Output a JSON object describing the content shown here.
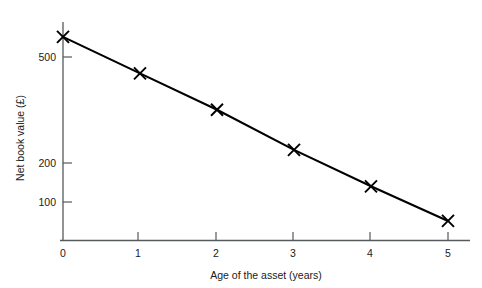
{
  "chart_data": {
    "type": "line",
    "title": "",
    "subtitle": "",
    "xlabel": "Age of the asset (years)",
    "ylabel": "Net book value (£)",
    "x": [
      0,
      1,
      2,
      3,
      4,
      5
    ],
    "values": [
      560,
      460,
      360,
      250,
      150,
      55
    ],
    "series": [
      {
        "name": "Net book value",
        "values": [
          560,
          460,
          360,
          250,
          150,
          55
        ]
      }
    ],
    "xlim": [
      0,
      5.2
    ],
    "ylim": [
      0,
      620
    ],
    "x_tick_labels": [
      "0",
      "1",
      "2",
      "3",
      "4",
      "5"
    ],
    "y_tick_labels": [
      "100",
      "200",
      "500"
    ],
    "x_ticks": [
      0,
      1,
      2,
      3,
      4,
      5
    ],
    "y_ticks": [
      100,
      200,
      500
    ],
    "grid": false,
    "legend": false,
    "legend_position": "none",
    "marker": "x",
    "line_color": "#000000",
    "axis_color": "#555a5c",
    "background_color": "#ffffff"
  },
  "axes": {
    "y_label": "Net book value (£)",
    "x_label": "Age of the asset (years)",
    "y_tick_500": "500",
    "y_tick_200": "200",
    "y_tick_100": "100",
    "origin_label": "0",
    "x_tick_1": "1",
    "x_tick_2": "2",
    "x_tick_3": "3",
    "x_tick_4": "4",
    "x_tick_5": "5"
  }
}
